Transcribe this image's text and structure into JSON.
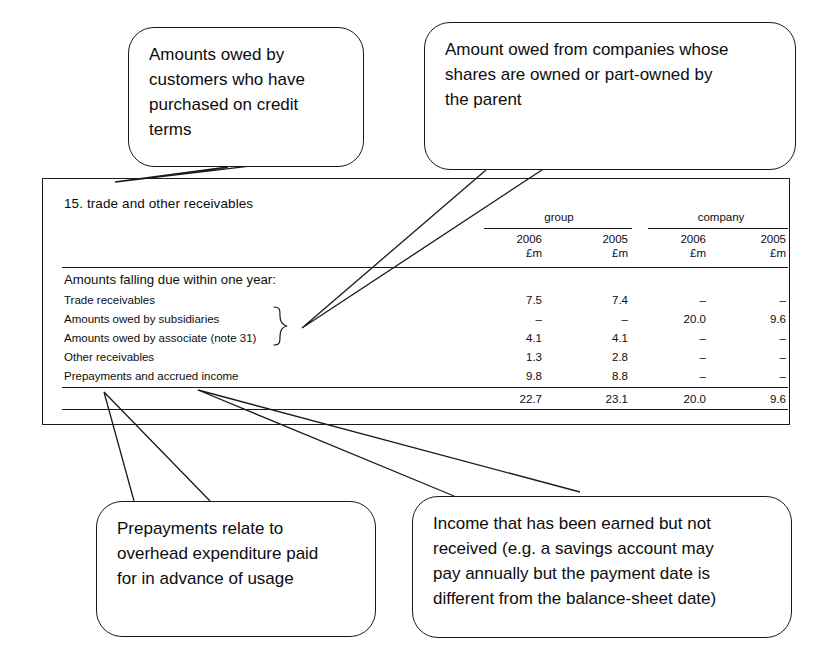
{
  "note": {
    "heading": "15. trade and other receivables",
    "column_groups": [
      {
        "label": "group"
      },
      {
        "label": "company"
      }
    ],
    "column_headers": [
      {
        "year": "2006",
        "unit": "£m"
      },
      {
        "year": "2005",
        "unit": "£m"
      },
      {
        "year": "2006",
        "unit": "£m"
      },
      {
        "year": "2005",
        "unit": "£m"
      }
    ],
    "section_label": "Amounts falling due within one year:",
    "rows": [
      {
        "label": "Trade receivables",
        "group_2006": "7.5",
        "group_2005": "7.4",
        "company_2006": "–",
        "company_2005": "–"
      },
      {
        "label": "Amounts owed by subsidiaries",
        "group_2006": "–",
        "group_2005": "–",
        "company_2006": "20.0",
        "company_2005": "9.6"
      },
      {
        "label": "Amounts owed by associate (note 31)",
        "group_2006": "4.1",
        "group_2005": "4.1",
        "company_2006": "–",
        "company_2005": "–"
      },
      {
        "label": "Other receivables",
        "group_2006": "1.3",
        "group_2005": "2.8",
        "company_2006": "–",
        "company_2005": "–"
      },
      {
        "label": "Prepayments and accrued income",
        "group_2006": "9.8",
        "group_2005": "8.8",
        "company_2006": "–",
        "company_2005": "–"
      }
    ],
    "total": {
      "label": "",
      "group_2006": "22.7",
      "group_2005": "23.1",
      "company_2006": "20.0",
      "company_2005": "9.6"
    }
  },
  "annotations": [
    {
      "id": "trade-receivables-note",
      "lines": [
        "Amounts owed by",
        "customers who have",
        "purchased on credit",
        "terms"
      ]
    },
    {
      "id": "intercompany-note",
      "lines": [
        "Amount owed from companies whose",
        "shares are owned or part-owned by",
        "the parent"
      ]
    },
    {
      "id": "prepayments-note",
      "lines": [
        "Prepayments relate to",
        "overhead expenditure paid",
        "for in advance of usage"
      ]
    },
    {
      "id": "accrued-income-note",
      "lines": [
        "Income that has been earned but not",
        "received (e.g. a savings account may",
        "pay annually but the payment date is",
        "different from the balance-sheet date)"
      ]
    }
  ],
  "colors": {
    "ink": "#1a1a1a",
    "page": "#ffffff"
  }
}
